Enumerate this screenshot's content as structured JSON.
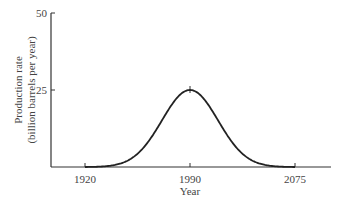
{
  "chart_data": {
    "type": "line",
    "title": "",
    "xlabel": "Year",
    "ylabel": "Production rate",
    "ylabel_sub": "(billion barrels per year)",
    "x_ticks": [
      "1920",
      "1990",
      "2075"
    ],
    "y_ticks": [
      "25",
      "50"
    ],
    "xlim": [
      1898,
      2098
    ],
    "ylim": [
      0,
      50
    ],
    "grid": false,
    "series": [
      {
        "name": "Production rate",
        "x": [
          1920,
          1940,
          1955,
          1970,
          1980,
          1990,
          2000,
          2010,
          2025,
          2040,
          2060,
          2075
        ],
        "values": [
          0,
          1.5,
          5,
          14,
          21,
          25,
          21,
          14,
          5,
          1.5,
          0.2,
          0
        ]
      }
    ],
    "annotations": [
      "peak at 1990, 25 billion barrels per year"
    ]
  }
}
